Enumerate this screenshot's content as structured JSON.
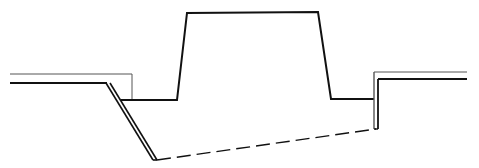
{
  "diagram": {
    "type": "cross-section",
    "colors": {
      "background": "#ffffff",
      "stroke": "#111111",
      "thin_stroke": "#555555"
    },
    "labels": []
  }
}
